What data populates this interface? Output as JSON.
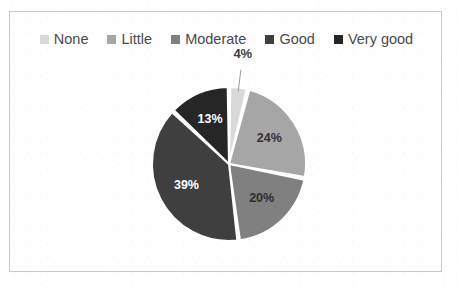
{
  "frame": {
    "border_color": "#c9c9c9",
    "background": "#fefefe"
  },
  "legend": {
    "position": "top",
    "items": [
      {
        "label": "None",
        "color": "#d9d9d9"
      },
      {
        "label": "Little",
        "color": "#a6a6a6"
      },
      {
        "label": "Moderate",
        "color": "#808080"
      },
      {
        "label": "Good",
        "color": "#3f3f3f"
      },
      {
        "label": "Very good",
        "color": "#262626"
      }
    ]
  },
  "chart_data": {
    "type": "pie",
    "title": "",
    "subtitle": "",
    "xlabel": "",
    "ylabel": "",
    "legend_position": "top",
    "grid": false,
    "start_angle_deg": 0,
    "direction": "clockwise",
    "gap_color": "#ffffff",
    "categories": [
      "None",
      "Little",
      "Moderate",
      "Good",
      "Very good"
    ],
    "values": [
      4,
      24,
      20,
      39,
      13
    ],
    "value_unit": "%",
    "slices": [
      {
        "label": "None",
        "value": 4,
        "display": "4%",
        "color": "#d9d9d9",
        "label_color": "#3d3d3d",
        "label_placement": "outside",
        "leader_line": true
      },
      {
        "label": "Little",
        "value": 24,
        "display": "24%",
        "color": "#a6a6a6",
        "label_color": "#333333",
        "label_placement": "inside",
        "leader_line": false
      },
      {
        "label": "Moderate",
        "value": 20,
        "display": "20%",
        "color": "#808080",
        "label_color": "#2e2e2e",
        "label_placement": "inside",
        "leader_line": false
      },
      {
        "label": "Good",
        "value": 39,
        "display": "39%",
        "color": "#3f3f3f",
        "label_color": "#ffffff",
        "label_placement": "inside",
        "leader_line": false
      },
      {
        "label": "Very good",
        "value": 13,
        "display": "13%",
        "color": "#262626",
        "label_color": "#ffffff",
        "label_placement": "inside",
        "leader_line": false
      }
    ]
  }
}
